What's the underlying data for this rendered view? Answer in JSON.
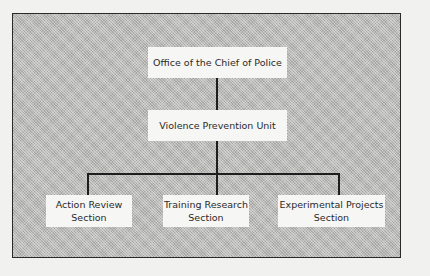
{
  "diagram": {
    "type": "org-chart",
    "nodes": [
      {
        "id": "office",
        "label": "Office of the Chief of Police",
        "level": 0
      },
      {
        "id": "vpu",
        "label": "Violence Prevention Unit",
        "level": 1,
        "parent": "office"
      },
      {
        "id": "action",
        "label_line1": "Action Review",
        "label_line2": "Section",
        "level": 2,
        "parent": "vpu"
      },
      {
        "id": "training",
        "label_line1": "Training Research",
        "label_line2": "Section",
        "level": 2,
        "parent": "vpu"
      },
      {
        "id": "experimental",
        "label_line1": "Experimental Projects",
        "label_line2": "Section",
        "level": 2,
        "parent": "vpu"
      }
    ]
  }
}
